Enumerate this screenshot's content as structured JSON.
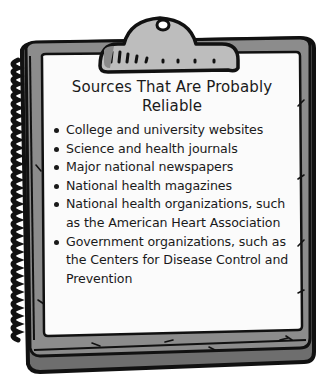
{
  "card": {
    "title_line1": "Sources That Are Probably",
    "title_line2": "Reliable",
    "items": [
      {
        "text": "College and university websites"
      },
      {
        "text": "Science and health journals"
      },
      {
        "text": "Major national newspapers"
      },
      {
        "text": "National health magazines"
      },
      {
        "text": "National health organizations, such as the American Heart Association"
      },
      {
        "text": "Government organizations, such as the Centers for Disease Control and Prevention"
      }
    ]
  },
  "colors": {
    "outline": "#111111",
    "board": "#8c8c8c",
    "board_dark": "#6e6e6e",
    "clip": "#bdbdbd",
    "paper": "#fbfbfb"
  }
}
